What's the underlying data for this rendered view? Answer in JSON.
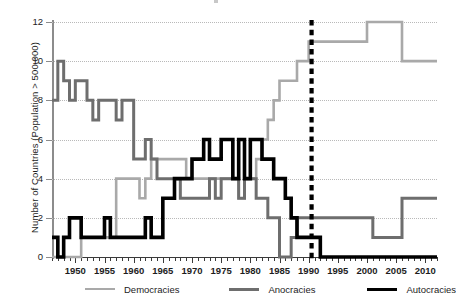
{
  "chart_data": {
    "type": "line",
    "title": "",
    "xlabel": "",
    "ylabel": "Number of Countries (Population > 500,000)",
    "xlim": [
      1946,
      2012
    ],
    "ylim": [
      0,
      12
    ],
    "grid": true,
    "legend_position": "bottom",
    "x_tick_labels": [
      "1950",
      "1955",
      "1960",
      "1965",
      "1970",
      "1975",
      "1980",
      "1985",
      "1990",
      "1995",
      "2000",
      "2005",
      "2010"
    ],
    "x_tick_values": [
      1950,
      1955,
      1960,
      1965,
      1970,
      1975,
      1980,
      1985,
      1990,
      1995,
      2000,
      2005,
      2010
    ],
    "y_tick_labels": [
      "0",
      "2",
      "4",
      "6",
      "8",
      "10",
      "12"
    ],
    "y_tick_values": [
      0,
      2,
      4,
      6,
      8,
      10,
      12
    ],
    "x": [
      1946,
      1947,
      1948,
      1949,
      1950,
      1951,
      1952,
      1953,
      1954,
      1955,
      1956,
      1957,
      1958,
      1959,
      1960,
      1961,
      1962,
      1963,
      1964,
      1965,
      1966,
      1967,
      1968,
      1969,
      1970,
      1971,
      1972,
      1973,
      1974,
      1975,
      1976,
      1977,
      1978,
      1979,
      1980,
      1981,
      1982,
      1983,
      1984,
      1985,
      1986,
      1987,
      1988,
      1989,
      1990,
      1991,
      1992,
      1993,
      1994,
      1995,
      1996,
      1997,
      1998,
      1999,
      2000,
      2001,
      2002,
      2003,
      2004,
      2005,
      2006,
      2007,
      2008,
      2009,
      2010,
      2011,
      2012
    ],
    "series": [
      {
        "name": "Democracies",
        "color": "#a9a9a9",
        "values": [
          0,
          0,
          0,
          0,
          0,
          1,
          1,
          1,
          1,
          1,
          1,
          4,
          4,
          4,
          4,
          3,
          4,
          5,
          5,
          5,
          5,
          5,
          5,
          4,
          4,
          4,
          4,
          4,
          4,
          4,
          4,
          4,
          3,
          4,
          4,
          5,
          6,
          7,
          8,
          9,
          9,
          9,
          10,
          10,
          11,
          11,
          11,
          11,
          11,
          11,
          11,
          11,
          11,
          11,
          12,
          12,
          12,
          12,
          12,
          12,
          10,
          10,
          10,
          10,
          10,
          10,
          10
        ]
      },
      {
        "name": "Anocracies",
        "color": "#6e6e6e",
        "values": [
          8,
          10,
          9,
          8,
          9,
          9,
          8,
          7,
          8,
          8,
          8,
          7,
          8,
          8,
          5,
          5,
          6,
          5,
          4,
          4,
          4,
          4,
          3,
          3,
          3,
          3,
          3,
          4,
          3,
          4,
          4,
          4,
          3,
          4,
          4,
          3,
          3,
          2,
          2,
          0,
          0,
          1,
          2,
          2,
          2,
          2,
          2,
          2,
          2,
          2,
          2,
          2,
          2,
          2,
          2,
          1,
          1,
          1,
          1,
          1,
          3,
          3,
          3,
          3,
          3,
          3,
          3
        ]
      },
      {
        "name": "Autocracies",
        "color": "#000000",
        "values": [
          1,
          0,
          1,
          2,
          2,
          1,
          1,
          1,
          1,
          2,
          1,
          1,
          1,
          1,
          1,
          1,
          2,
          1,
          1,
          3,
          3,
          4,
          4,
          4,
          5,
          5,
          6,
          5,
          5,
          6,
          6,
          4,
          6,
          4,
          6,
          6,
          5,
          5,
          4,
          4,
          3,
          2,
          1,
          1,
          1,
          1,
          0,
          0,
          0,
          0,
          0,
          0,
          0,
          0,
          0,
          0,
          0,
          0,
          0,
          0,
          0,
          0,
          0,
          0,
          0,
          0,
          0
        ]
      }
    ],
    "annotations": [
      {
        "name": "event-line",
        "type": "vertical-dashed-line",
        "x": 1990.5,
        "color": "#000000"
      }
    ]
  },
  "legend": {
    "items": [
      {
        "label": "Democracies",
        "color": "#a9a9a9",
        "width": 2.6
      },
      {
        "label": "Anocracies",
        "color": "#6e6e6e",
        "width": 3.0
      },
      {
        "label": "Autocracies",
        "color": "#000000",
        "width": 3.6
      }
    ]
  },
  "axes": {
    "y_title": "Number of Countries (Population > 500,000)"
  }
}
